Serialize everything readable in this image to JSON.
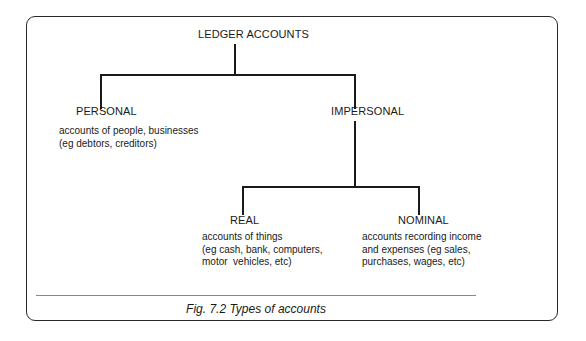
{
  "diagram": {
    "type": "tree",
    "root": {
      "label": "LEDGER ACCOUNTS"
    },
    "personal": {
      "label": "PERSONAL",
      "description": "accounts of people, businesses\n(eg debtors, creditors)"
    },
    "impersonal": {
      "label": "IMPERSONAL"
    },
    "real": {
      "label": "REAL",
      "description": "accounts of things\n(eg cash, bank, computers,\nmotor  vehicles, etc)"
    },
    "nominal": {
      "label": "NOMINAL",
      "description": "accounts recording income\nand expenses (eg sales,\npurchases, wages, etc)"
    },
    "edges": [
      [
        "LEDGER ACCOUNTS",
        "PERSONAL"
      ],
      [
        "LEDGER ACCOUNTS",
        "IMPERSONAL"
      ],
      [
        "IMPERSONAL",
        "REAL"
      ],
      [
        "IMPERSONAL",
        "NOMINAL"
      ]
    ]
  },
  "caption": "Fig. 7.2  Types of accounts"
}
